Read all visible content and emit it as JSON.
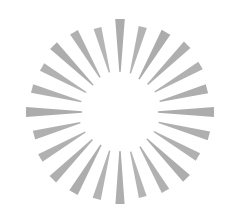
{
  "graphic": {
    "name": "radial-sunburst",
    "title": "Sunburst / starburst radial ray graphic",
    "background_color": "#ffffff",
    "ray_color": "#a8a8a8",
    "ray_color_light": "#bdbdbd",
    "canvas": {
      "width": 239,
      "height": 224
    },
    "center": {
      "x": 120,
      "y": 112
    },
    "ray_count": 24,
    "inner_radius": 38,
    "outer_radius": 94,
    "outer_half_width": 4.6,
    "inner_half_width": 0.7,
    "angle_step_degrees": 15,
    "start_angle_degrees": -90,
    "rays": [
      {
        "index": 0,
        "angle": -90,
        "inner_radius": 40,
        "outer_radius": 93,
        "outer_half_width": 4.8,
        "opacity": 0.95
      },
      {
        "index": 1,
        "angle": -75,
        "inner_radius": 40,
        "outer_radius": 88,
        "outer_half_width": 4.2,
        "opacity": 0.88
      },
      {
        "index": 2,
        "angle": -60,
        "inner_radius": 38,
        "outer_radius": 92,
        "outer_half_width": 5.0,
        "opacity": 0.95
      },
      {
        "index": 3,
        "angle": -45,
        "inner_radius": 39,
        "outer_radius": 95,
        "outer_half_width": 4.6,
        "opacity": 0.92
      },
      {
        "index": 4,
        "angle": -30,
        "inner_radius": 40,
        "outer_radius": 93,
        "outer_half_width": 4.4,
        "opacity": 0.9
      },
      {
        "index": 5,
        "angle": -15,
        "inner_radius": 41,
        "outer_radius": 90,
        "outer_half_width": 4.6,
        "opacity": 0.93
      },
      {
        "index": 6,
        "angle": 0,
        "inner_radius": 38,
        "outer_radius": 94,
        "outer_half_width": 5.0,
        "opacity": 0.95
      },
      {
        "index": 7,
        "angle": 15,
        "inner_radius": 40,
        "outer_radius": 92,
        "outer_half_width": 4.5,
        "opacity": 0.92
      },
      {
        "index": 8,
        "angle": 30,
        "inner_radius": 39,
        "outer_radius": 90,
        "outer_half_width": 4.4,
        "opacity": 0.9
      },
      {
        "index": 9,
        "angle": 45,
        "inner_radius": 38,
        "outer_radius": 94,
        "outer_half_width": 4.8,
        "opacity": 0.94
      },
      {
        "index": 10,
        "angle": 60,
        "inner_radius": 40,
        "outer_radius": 91,
        "outer_half_width": 4.3,
        "opacity": 0.9
      },
      {
        "index": 11,
        "angle": 75,
        "inner_radius": 41,
        "outer_radius": 88,
        "outer_half_width": 4.0,
        "opacity": 0.86
      },
      {
        "index": 12,
        "angle": 90,
        "inner_radius": 39,
        "outer_radius": 92,
        "outer_half_width": 4.6,
        "opacity": 0.93
      },
      {
        "index": 13,
        "angle": 105,
        "inner_radius": 40,
        "outer_radius": 90,
        "outer_half_width": 4.2,
        "opacity": 0.88
      },
      {
        "index": 14,
        "angle": 120,
        "inner_radius": 38,
        "outer_radius": 93,
        "outer_half_width": 4.8,
        "opacity": 0.94
      },
      {
        "index": 15,
        "angle": 135,
        "inner_radius": 39,
        "outer_radius": 95,
        "outer_half_width": 4.6,
        "opacity": 0.92
      },
      {
        "index": 16,
        "angle": 150,
        "inner_radius": 40,
        "outer_radius": 92,
        "outer_half_width": 4.4,
        "opacity": 0.9
      },
      {
        "index": 17,
        "angle": 165,
        "inner_radius": 41,
        "outer_radius": 89,
        "outer_half_width": 4.5,
        "opacity": 0.91
      },
      {
        "index": 18,
        "angle": 180,
        "inner_radius": 38,
        "outer_radius": 94,
        "outer_half_width": 5.0,
        "opacity": 0.95
      },
      {
        "index": 19,
        "angle": 195,
        "inner_radius": 40,
        "outer_radius": 91,
        "outer_half_width": 4.4,
        "opacity": 0.9
      },
      {
        "index": 20,
        "angle": 210,
        "inner_radius": 39,
        "outer_radius": 90,
        "outer_half_width": 4.3,
        "opacity": 0.89
      },
      {
        "index": 21,
        "angle": 225,
        "inner_radius": 38,
        "outer_radius": 94,
        "outer_half_width": 4.8,
        "opacity": 0.94
      },
      {
        "index": 22,
        "angle": 240,
        "inner_radius": 40,
        "outer_radius": 92,
        "outer_half_width": 4.5,
        "opacity": 0.91
      },
      {
        "index": 23,
        "angle": 255,
        "inner_radius": 41,
        "outer_radius": 87,
        "outer_half_width": 4.0,
        "opacity": 0.85
      }
    ]
  }
}
